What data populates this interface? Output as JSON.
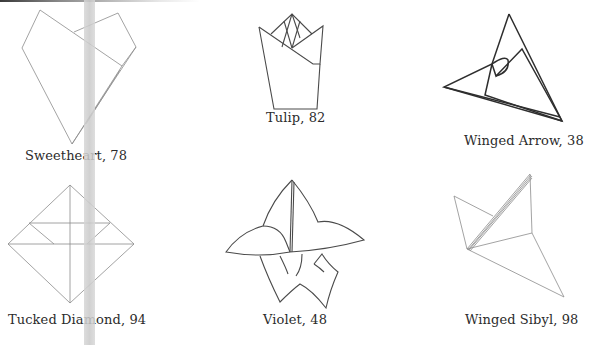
{
  "page": {
    "background": "#ffffff",
    "binding_band_color": "#cccccc"
  },
  "models": [
    {
      "id": "sweetheart",
      "caption": "Sweetheart, 78",
      "name": "Sweetheart",
      "page": 78
    },
    {
      "id": "tulip",
      "caption": "Tulip, 82",
      "name": "Tulip",
      "page": 82
    },
    {
      "id": "winged-arrow",
      "caption": "Winged Arrow, 38",
      "name": "Winged Arrow",
      "page": 38
    },
    {
      "id": "tucked-diamond",
      "caption": "Tucked Diamond, 94",
      "name": "Tucked Diamond",
      "page": 94
    },
    {
      "id": "violet",
      "caption": "Violet, 48",
      "name": "Violet",
      "page": 48
    },
    {
      "id": "winged-sibyl",
      "caption": "Winged Sibyl, 98",
      "name": "Winged Sibyl",
      "page": 98
    }
  ]
}
